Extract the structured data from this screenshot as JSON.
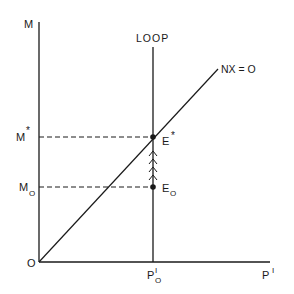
{
  "diagram": {
    "axes": {
      "y_label": "M",
      "x_label_main": "P",
      "x_label_sup": "I",
      "origin_label": "O"
    },
    "curves": {
      "loop_label": "LOOP",
      "nx_label": "NX = O"
    },
    "levels": {
      "m_star_main": "M",
      "m_star_sup": "*",
      "m_zero_main": "M",
      "m_zero_sub": "O"
    },
    "points": {
      "e_star_main": "E",
      "e_star_sup": "*",
      "e_zero_main": "E",
      "e_zero_sub": "O"
    },
    "x_tick": {
      "main": "P",
      "sup": "I",
      "sub": "O"
    },
    "colors": {
      "ink": "#1a1a1a",
      "background": "#ffffff"
    }
  }
}
